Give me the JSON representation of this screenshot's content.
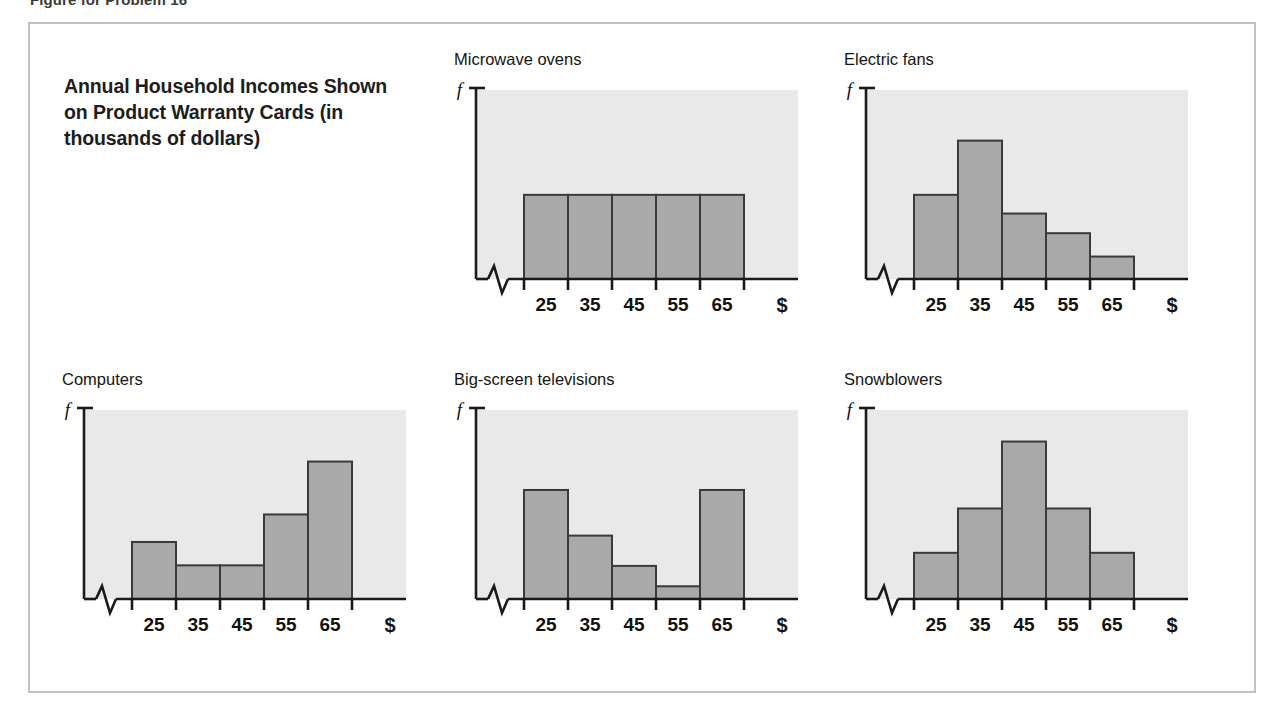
{
  "figure": {
    "caption": "Figure for Problem 16",
    "headline": "Annual Household Incomes Shown on Product Warranty Cards (in thousands of dollars)",
    "border_color": "#bcc2c8",
    "background_color": "#ffffff"
  },
  "style": {
    "plot_background": "#e9e9e9",
    "bar_fill": "#a9a9a9",
    "bar_stroke": "#3a3a3a",
    "axis_color": "#1a1a1a"
  },
  "axis": {
    "y_label": "f",
    "x_label": "$",
    "tick_labels": [
      "25",
      "35",
      "45",
      "55",
      "65"
    ],
    "has_axis_break": true
  },
  "chart_data": [
    {
      "type": "bar",
      "title": "Microwave ovens",
      "categories": [
        "25",
        "35",
        "45",
        "55",
        "65"
      ],
      "values": [
        0.45,
        0.45,
        0.45,
        0.45,
        0.45
      ],
      "xlabel": "$",
      "ylabel": "f",
      "ylim": [
        0,
        1
      ],
      "shape": "uniform",
      "grid": false,
      "legend": "none"
    },
    {
      "type": "bar",
      "title": "Electric fans",
      "categories": [
        "25",
        "35",
        "45",
        "55",
        "65"
      ],
      "values": [
        0.45,
        0.74,
        0.35,
        0.245,
        0.12
      ],
      "xlabel": "$",
      "ylabel": "f",
      "ylim": [
        0,
        1
      ],
      "shape": "skewed-right",
      "grid": false,
      "legend": "none"
    },
    {
      "type": "bar",
      "title": "Computers",
      "categories": [
        "25",
        "35",
        "45",
        "55",
        "65"
      ],
      "values": [
        0.305,
        0.18,
        0.18,
        0.452,
        0.735
      ],
      "xlabel": "$",
      "ylabel": "f",
      "ylim": [
        0,
        1
      ],
      "shape": "skewed-left",
      "grid": false,
      "legend": "none"
    },
    {
      "type": "bar",
      "title": "Big-screen televisions",
      "categories": [
        "25",
        "35",
        "45",
        "55",
        "65"
      ],
      "values": [
        0.583,
        0.339,
        0.177,
        0.068,
        0.583
      ],
      "xlabel": "$",
      "ylabel": "f",
      "ylim": [
        0,
        1
      ],
      "shape": "bimodal-j",
      "grid": false,
      "legend": "none"
    },
    {
      "type": "bar",
      "title": "Snowblowers",
      "categories": [
        "25",
        "35",
        "45",
        "55",
        "65"
      ],
      "values": [
        0.247,
        0.484,
        0.842,
        0.484,
        0.247
      ],
      "xlabel": "$",
      "ylabel": "f",
      "ylim": [
        0,
        1
      ],
      "shape": "symmetric-bell",
      "grid": false,
      "legend": "none"
    }
  ]
}
